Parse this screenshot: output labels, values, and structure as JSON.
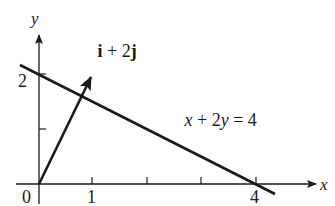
{
  "diagram": {
    "axes": {
      "x_label": "x",
      "y_label": "y",
      "origin_label": "0",
      "x_tick_labels": [
        "1",
        "4"
      ],
      "y_tick_labels": [
        "2"
      ],
      "x_ticks": [
        1,
        2,
        3,
        4
      ],
      "y_ticks": [
        1,
        2
      ]
    },
    "line": {
      "label_parts": [
        "x",
        " + 2",
        "y",
        " = 4"
      ],
      "equation": "x + 2y = 4",
      "x_intercept": 4,
      "y_intercept": 2
    },
    "vector": {
      "label_i": "i",
      "label_mid": " + 2",
      "label_j": "j",
      "expression": "i + 2j",
      "components": [
        1,
        2
      ]
    },
    "colors": {
      "ink": "#1a1a1a",
      "background": "#ffffff"
    }
  }
}
